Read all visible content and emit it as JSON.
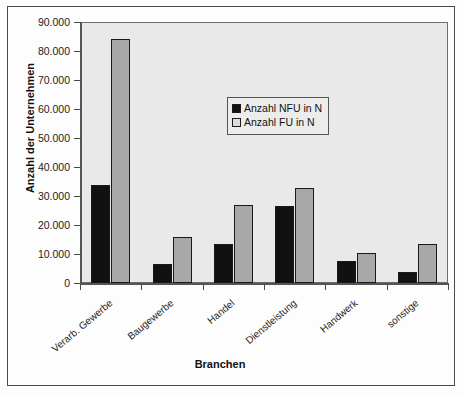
{
  "chart_data": {
    "type": "bar",
    "title": "",
    "xlabel": "Branchen",
    "ylabel": "Anzahl der Unternehmen",
    "ylim": [
      0,
      90000
    ],
    "ytick_step": 10000,
    "grid": false,
    "legend_position": "inside-upper-center",
    "categories": [
      "Verarb. Gewerbe",
      "Baugewerbe",
      "Handel",
      "Dienstleistung",
      "Handwerk",
      "sonstige"
    ],
    "ytick_labels": [
      "90.000",
      "80.000",
      "70.000",
      "60.000",
      "50.000",
      "40.000",
      "30.000",
      "20.000",
      "10.000",
      "0"
    ],
    "ytick_values": [
      90000,
      80000,
      70000,
      60000,
      50000,
      40000,
      30000,
      20000,
      10000,
      0
    ],
    "series": [
      {
        "name": "Anzahl NFU in N",
        "color": "#111111",
        "values": [
          33800,
          6500,
          13500,
          26500,
          7700,
          3800
        ]
      },
      {
        "name": "Anzahl FU in N",
        "color": "#a8a8a8",
        "values": [
          84000,
          15800,
          27000,
          32800,
          10500,
          13500
        ]
      }
    ]
  },
  "legend": {
    "entries": [
      {
        "label": "Anzahl NFU in N",
        "swatch": "black-square"
      },
      {
        "label": "Anzahl FU in N",
        "swatch": "white-square"
      }
    ]
  },
  "axes": {
    "y_title": "Anzahl der Unternehmen",
    "x_title": "Branchen"
  }
}
